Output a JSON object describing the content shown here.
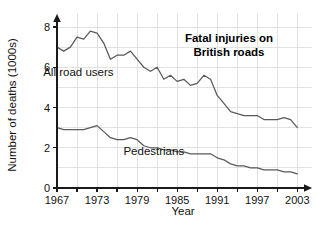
{
  "chart_data": {
    "type": "line",
    "title": "Fatal injuries on British roads",
    "title_line1": "Fatal injuries on",
    "title_line2": "British roads",
    "xlabel": "Year",
    "ylabel": "Number of deaths (1000s)",
    "xlim": [
      1967,
      2004
    ],
    "ylim": [
      0,
      8
    ],
    "xticks": [
      1967,
      1973,
      1979,
      1985,
      1991,
      1997,
      2003
    ],
    "xtick_labels": [
      "1967",
      "1973",
      "1979",
      "1985",
      "1991",
      "1997",
      "2003"
    ],
    "yticks": [
      0,
      2,
      4,
      6,
      8
    ],
    "ytick_labels": [
      "0",
      "2",
      "4",
      "6",
      "8"
    ],
    "minor_xtick_step": 3,
    "grid": true,
    "grid_color": "#e2e2e2",
    "line_color": "#5a5a5a",
    "legend": "inline-labels",
    "x": [
      1967,
      1968,
      1969,
      1970,
      1971,
      1972,
      1973,
      1974,
      1975,
      1976,
      1977,
      1978,
      1979,
      1980,
      1981,
      1982,
      1983,
      1984,
      1985,
      1986,
      1987,
      1988,
      1989,
      1990,
      1991,
      1992,
      1993,
      1994,
      1995,
      1996,
      1997,
      1998,
      1999,
      2000,
      2001,
      2002,
      2003
    ],
    "series": [
      {
        "name": "All road users",
        "label": "All road users",
        "label_x": 1970.2,
        "label_y": 5.55,
        "values": [
          7.0,
          6.8,
          7.0,
          7.5,
          7.4,
          7.8,
          7.7,
          7.2,
          6.4,
          6.6,
          6.6,
          6.8,
          6.4,
          6.0,
          5.8,
          6.0,
          5.4,
          5.6,
          5.3,
          5.4,
          5.1,
          5.2,
          5.6,
          5.4,
          4.6,
          4.2,
          3.8,
          3.7,
          3.6,
          3.6,
          3.6,
          3.4,
          3.4,
          3.4,
          3.5,
          3.4,
          3.0
        ]
      },
      {
        "name": "Pedestrians",
        "label": "Pedestrians",
        "label_x": 1981.5,
        "label_y": 1.62,
        "values": [
          3.0,
          2.9,
          2.9,
          2.9,
          2.9,
          3.0,
          3.1,
          2.8,
          2.5,
          2.4,
          2.4,
          2.5,
          2.4,
          2.1,
          2.0,
          2.0,
          1.9,
          1.9,
          1.8,
          1.8,
          1.7,
          1.7,
          1.7,
          1.7,
          1.5,
          1.4,
          1.2,
          1.1,
          1.1,
          1.0,
          1.0,
          0.9,
          0.9,
          0.9,
          0.8,
          0.8,
          0.7
        ]
      }
    ]
  }
}
